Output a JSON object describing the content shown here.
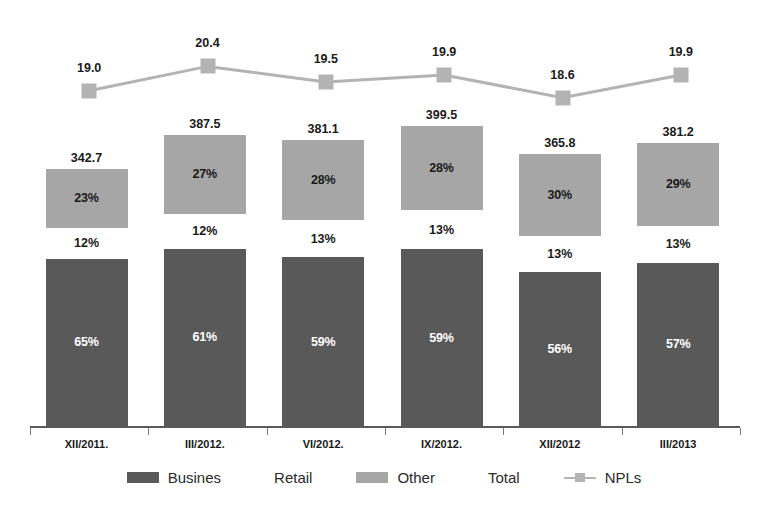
{
  "chart_data": {
    "type": "bar",
    "title": "",
    "subtitle": "",
    "xlabel": "",
    "ylabel": "",
    "grid": false,
    "legend_position": "bottom",
    "stacked": true,
    "categories": [
      "XII/2011.",
      "III/2012.",
      "VI/2012.",
      "IX/2012.",
      "XII/2012",
      "III/2013"
    ],
    "totals": [
      342.7,
      387.5,
      381.1,
      399.5,
      365.8,
      381.2
    ],
    "total_labels": [
      "342.7",
      "387.5",
      "381.1",
      "399.5",
      "365.8",
      "381.2"
    ],
    "series": [
      {
        "name": "Busines",
        "unit": "%",
        "values": [
          65,
          61,
          59,
          59,
          56,
          57
        ],
        "labels": [
          "65%",
          "61%",
          "59%",
          "59%",
          "56%",
          "57%"
        ],
        "color": "#595959"
      },
      {
        "name": "Retail",
        "unit": "%",
        "values": [
          12,
          12,
          13,
          13,
          13,
          13
        ],
        "labels": [
          "12%",
          "12%",
          "13%",
          "13%",
          "13%",
          "13%"
        ],
        "color": "#ffffff"
      },
      {
        "name": "Other",
        "unit": "%",
        "values": [
          23,
          27,
          28,
          28,
          30,
          29
        ],
        "labels": [
          "23%",
          "27%",
          "28%",
          "28%",
          "30%",
          "29%"
        ],
        "color": "#a6a6a6"
      }
    ],
    "line_series": {
      "name": "NPLs",
      "values": [
        19.0,
        20.4,
        19.5,
        19.9,
        18.6,
        19.9
      ],
      "labels": [
        "19.0",
        "20.4",
        "19.5",
        "19.9",
        "18.6",
        "19.9"
      ],
      "color": "#b3b3b3",
      "ylim": [
        18.0,
        21.0
      ]
    },
    "legend_entries": [
      {
        "label": "Busines",
        "swatch": "dark-square"
      },
      {
        "label": "Retail",
        "swatch": "none"
      },
      {
        "label": "Other",
        "swatch": "gray-square"
      },
      {
        "label": "Total",
        "swatch": "none"
      },
      {
        "label": "NPLs",
        "swatch": "line-marker"
      }
    ]
  },
  "colors": {
    "busines": "#595959",
    "other": "#a6a6a6",
    "npl_line": "#b3b3b3",
    "axis": "#5a5a5a",
    "text": "#1a1a1a",
    "background": "#ffffff"
  }
}
